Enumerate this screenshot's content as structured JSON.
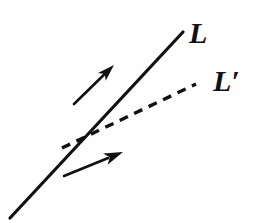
{
  "figure": {
    "background_color": "#fefefe",
    "stroke_color": "#111111",
    "width": 259,
    "height": 223
  },
  "labels": {
    "line_L": "L",
    "line_L_prime": "L′"
  },
  "geometry": {
    "line_L": {
      "style": "solid",
      "x1": 10,
      "y1": 218,
      "x2": 183,
      "y2": 32,
      "stroke_width": 3.2
    },
    "line_L_prime": {
      "style": "dashed",
      "x1": 62,
      "y1": 148,
      "x2": 196,
      "y2": 84,
      "stroke_width": 3.4,
      "dash_pattern": "9 7"
    },
    "arrow_upper": {
      "tail_x": 74,
      "tail_y": 104,
      "tip_x": 114,
      "tip_y": 65,
      "stroke_width": 2.6,
      "head_length": 17,
      "head_width": 11
    },
    "arrow_lower": {
      "tail_x": 64,
      "tail_y": 176,
      "tip_x": 123,
      "tip_y": 152,
      "stroke_width": 2.6,
      "head_length": 19,
      "head_width": 12
    }
  }
}
